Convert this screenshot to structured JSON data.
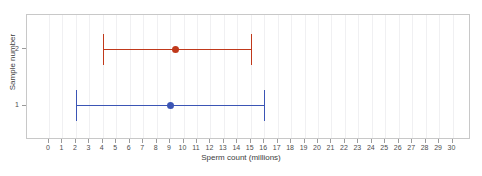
{
  "chart_data": {
    "type": "scatter",
    "title": "",
    "xlabel": "Sperm count (millions)",
    "ylabel": "Sample number",
    "xlim": [
      0,
      30
    ],
    "ylim": [
      0.4,
      2.6
    ],
    "grid": true,
    "grid_axis": "x",
    "legend": "none",
    "orientation": "horizontal",
    "error_bars": "horizontal",
    "xticks": [
      0,
      1,
      2,
      3,
      4,
      5,
      6,
      7,
      8,
      9,
      10,
      11,
      12,
      13,
      14,
      15,
      16,
      17,
      18,
      19,
      20,
      21,
      22,
      23,
      24,
      25,
      26,
      27,
      28,
      29,
      30
    ],
    "xtick_labels": [
      "0",
      "1",
      "2",
      "3",
      "4",
      "5",
      "6",
      "7",
      "8",
      "9",
      "10",
      "11",
      "12",
      "13",
      "14",
      "15",
      "16",
      "17",
      "18",
      "19",
      "20",
      "21",
      "22",
      "23",
      "24",
      "25",
      "26",
      "27",
      "28",
      "29",
      "30"
    ],
    "yticks": [
      1,
      2
    ],
    "ytick_labels": [
      "1",
      "2"
    ],
    "series": [
      {
        "name": "2",
        "y": 2,
        "value": 9.4,
        "low": 4,
        "high": 15,
        "color": "#c0391b"
      },
      {
        "name": "1",
        "y": 1,
        "value": 9.0,
        "low": 2,
        "high": 16,
        "color": "#3b55b5"
      }
    ]
  },
  "colors": {
    "series_2": "#c0391b",
    "series_1": "#3b55b5",
    "grid": "#f0f0f2",
    "frame": "#c8c8c8",
    "tick": "#9a9a9a",
    "text": "#4d4d4d",
    "background": "#ffffff"
  }
}
